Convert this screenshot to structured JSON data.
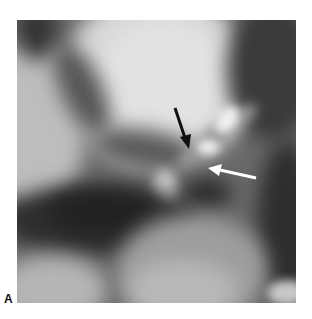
{
  "figure": {
    "panel_label": "A",
    "image_type": "grayscale-ct-angiography",
    "annotations": [
      {
        "name": "black-arrow",
        "color": "#111111",
        "from": [
          175,
          108
        ],
        "to": [
          189,
          148
        ]
      },
      {
        "name": "white-arrow",
        "color": "#ffffff",
        "from": [
          256,
          178
        ],
        "to": [
          210,
          168
        ]
      }
    ]
  }
}
